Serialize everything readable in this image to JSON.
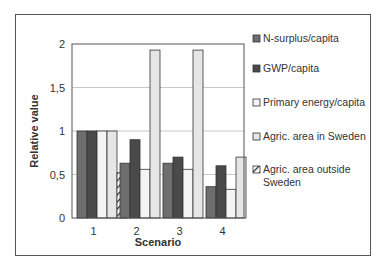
{
  "chart_data": {
    "type": "bar",
    "title": "",
    "xlabel": "Scenario",
    "ylabel": "Relative value",
    "categories": [
      "1",
      "2",
      "3",
      "4"
    ],
    "ylim": [
      0,
      2
    ],
    "yticks": [
      0,
      0.5,
      1,
      1.5,
      2
    ],
    "ytick_labels": [
      "0",
      "0,5",
      "1",
      "1,5",
      "2"
    ],
    "grid": true,
    "legend_position": "right",
    "series": [
      {
        "name": "N-surplus/capita",
        "color": "#6e6e6e",
        "pattern": "solid",
        "values": [
          1.0,
          0.63,
          0.63,
          0.36
        ]
      },
      {
        "name": "GWP/capita",
        "color": "#4a4a4a",
        "pattern": "solid",
        "values": [
          1.0,
          0.9,
          0.7,
          0.6
        ]
      },
      {
        "name": "Primary energy/capita",
        "color": "#f4f4f4",
        "pattern": "solid",
        "values": [
          1.0,
          0.56,
          0.56,
          0.33
        ]
      },
      {
        "name": "Agric. area in Sweden",
        "color": "#e6e6e6",
        "pattern": "solid",
        "values": [
          1.0,
          1.93,
          1.93,
          0.7
        ]
      },
      {
        "name": "Agric. area outside Sweden",
        "color": "#ffffff",
        "pattern": "hatched",
        "values": [
          0.52,
          null,
          null,
          null
        ]
      }
    ],
    "legend_lines": [
      [
        "N-surplus/capita"
      ],
      [
        "GWP/capita"
      ],
      [
        "Primary energy/capita"
      ],
      [
        "Agric. area in Sweden"
      ],
      [
        "Agric. area outside",
        "Sweden"
      ]
    ]
  }
}
